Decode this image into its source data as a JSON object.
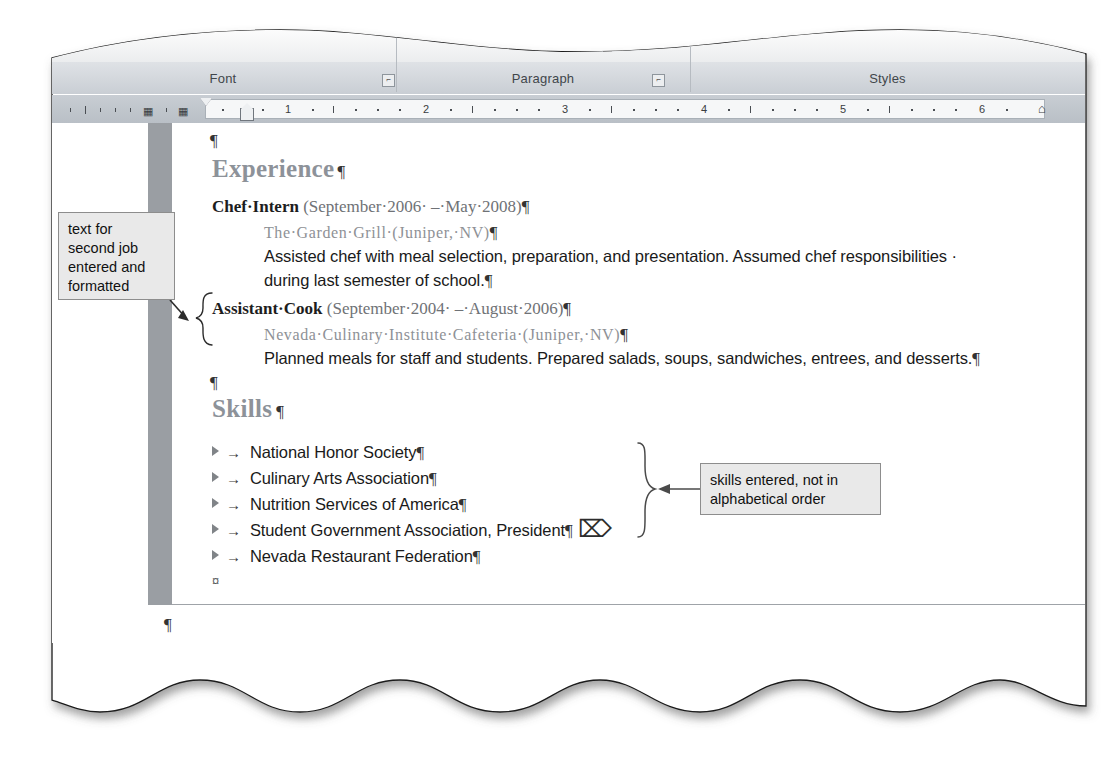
{
  "app": {
    "name": "Microsoft Word",
    "view": "print-layout"
  },
  "ribbon": {
    "groups": [
      {
        "label": "Font",
        "dialog_launcher": true
      },
      {
        "label": "Paragraph",
        "dialog_launcher": true
      },
      {
        "label": "Styles",
        "dialog_launcher": false
      }
    ],
    "ghost_buttons": [
      {
        "label": "A"
      },
      {
        "label": "Aa"
      }
    ],
    "ghost_right_labels": [
      "al ...",
      "¶ Recip"
    ]
  },
  "ruler": {
    "unit_labels": [
      "1",
      "2",
      "3",
      "4",
      "5",
      "6"
    ],
    "left_margin_icons": [
      "tab-stop-icon",
      "tab-stop-icon"
    ],
    "first_line_indent_marker": "first-line-indent",
    "left_indent_marker": "left-indent",
    "right_indent_marker": "right-indent"
  },
  "document": {
    "blocks": [
      {
        "type": "empty",
        "text": "¶"
      },
      {
        "type": "heading",
        "text": "Experience",
        "mark": "¶"
      },
      {
        "type": "job_title",
        "bold_text": "Chef·Intern",
        "rest_text": " (September·2006· –·May·2008)",
        "mark": "¶"
      },
      {
        "type": "company",
        "text": "The·Garden·Grill·(Juniper,·NV)",
        "mark": "¶"
      },
      {
        "type": "body",
        "text": "Assisted chef with meal selection, preparation, and presentation. Assumed chef responsibilities ·",
        "mark": ""
      },
      {
        "type": "body",
        "text": "during last semester of school.",
        "mark": "¶"
      },
      {
        "type": "job_title",
        "bold_text": "Assistant·Cook",
        "rest_text": " (September·2004· –·August·2006)",
        "mark": "¶"
      },
      {
        "type": "company",
        "text": "Nevada·Culinary·Institute·Cafeteria·(Juniper,·NV)",
        "mark": "¶"
      },
      {
        "type": "body",
        "text": "Planned meals for staff and students. Prepared salads, soups, sandwiches, entrees, and desserts.",
        "mark": "¶"
      },
      {
        "type": "empty",
        "text": "¶"
      },
      {
        "type": "heading",
        "text": "Skills",
        "mark": "¶"
      }
    ],
    "skills_list": [
      {
        "text": "National Honor Society",
        "mark": "¶"
      },
      {
        "text": "Culinary Arts Association",
        "mark": "¶"
      },
      {
        "text": "Nutrition Services of America",
        "mark": "¶"
      },
      {
        "text": "Student Government Association, President",
        "mark": "¶"
      },
      {
        "text": "Nevada Restaurant Federation",
        "mark": "¶"
      }
    ],
    "end_of_content_mark": "¤",
    "footer_paragraph_mark": "¶",
    "tab_arrow": "→",
    "paragraph_mark": "¶"
  },
  "annotations": [
    {
      "id": "callout-left",
      "lines": [
        "text for",
        "second job",
        "entered and",
        "formatted"
      ],
      "points_to": "assistant-cook-block"
    },
    {
      "id": "callout-right",
      "lines": [
        "skills entered, not in",
        "alphabetical order"
      ],
      "points_to": "skills-list"
    }
  ],
  "cursor": {
    "type": "i-beam-text-cursor"
  },
  "colors": {
    "heading": "#8d9299",
    "callout_bg": "#e9e9e9",
    "callout_border": "#8d8d8d",
    "selection_bar": "#9a9ea3",
    "ribbon_band": "#c9ced4"
  }
}
